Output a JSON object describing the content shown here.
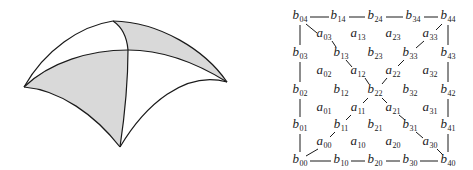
{
  "colors": {
    "stroke": "#1a1a1a",
    "shade": "#d9d9d9",
    "background": "#ffffff"
  },
  "surface_patch": {
    "description": "Triangular surface patch split into four sub-patches, two shaded",
    "corners": {
      "left": [
        24,
        87
      ],
      "top": [
        113,
        21
      ],
      "right": [
        227,
        82
      ],
      "bottom": [
        120,
        147
      ],
      "center": [
        128,
        50
      ]
    }
  },
  "control_net": {
    "b_points": [
      {
        "name": "b",
        "sub": "04",
        "x": 300,
        "y": 17
      },
      {
        "name": "b",
        "sub": "14",
        "x": 338,
        "y": 17
      },
      {
        "name": "b",
        "sub": "24",
        "x": 375,
        "y": 17
      },
      {
        "name": "b",
        "sub": "34",
        "x": 413,
        "y": 17
      },
      {
        "name": "b",
        "sub": "44",
        "x": 448,
        "y": 17
      },
      {
        "name": "b",
        "sub": "03",
        "x": 300,
        "y": 54
      },
      {
        "name": "b",
        "sub": "13",
        "x": 341,
        "y": 54
      },
      {
        "name": "b",
        "sub": "23",
        "x": 375,
        "y": 54
      },
      {
        "name": "b",
        "sub": "33",
        "x": 410,
        "y": 54
      },
      {
        "name": "b",
        "sub": "43",
        "x": 448,
        "y": 54
      },
      {
        "name": "b",
        "sub": "02",
        "x": 300,
        "y": 91
      },
      {
        "name": "b",
        "sub": "12",
        "x": 341,
        "y": 91
      },
      {
        "name": "b",
        "sub": "22",
        "x": 375,
        "y": 91
      },
      {
        "name": "b",
        "sub": "32",
        "x": 410,
        "y": 91
      },
      {
        "name": "b",
        "sub": "42",
        "x": 448,
        "y": 91
      },
      {
        "name": "b",
        "sub": "01",
        "x": 300,
        "y": 126
      },
      {
        "name": "b",
        "sub": "11",
        "x": 341,
        "y": 126
      },
      {
        "name": "b",
        "sub": "21",
        "x": 375,
        "y": 126
      },
      {
        "name": "b",
        "sub": "31",
        "x": 410,
        "y": 126
      },
      {
        "name": "b",
        "sub": "41",
        "x": 448,
        "y": 126
      },
      {
        "name": "b",
        "sub": "00",
        "x": 300,
        "y": 161
      },
      {
        "name": "b",
        "sub": "10",
        "x": 341,
        "y": 161
      },
      {
        "name": "b",
        "sub": "20",
        "x": 375,
        "y": 161
      },
      {
        "name": "b",
        "sub": "30",
        "x": 410,
        "y": 161
      },
      {
        "name": "b",
        "sub": "40",
        "x": 448,
        "y": 161
      }
    ],
    "a_points": [
      {
        "name": "a",
        "sub": "03",
        "x": 324,
        "y": 35
      },
      {
        "name": "a",
        "sub": "13",
        "x": 358,
        "y": 35
      },
      {
        "name": "a",
        "sub": "23",
        "x": 393,
        "y": 35
      },
      {
        "name": "a",
        "sub": "33",
        "x": 430,
        "y": 35
      },
      {
        "name": "a",
        "sub": "02",
        "x": 324,
        "y": 72
      },
      {
        "name": "a",
        "sub": "12",
        "x": 358,
        "y": 72
      },
      {
        "name": "a",
        "sub": "22",
        "x": 393,
        "y": 72
      },
      {
        "name": "a",
        "sub": "32",
        "x": 430,
        "y": 72
      },
      {
        "name": "a",
        "sub": "01",
        "x": 324,
        "y": 109
      },
      {
        "name": "a",
        "sub": "11",
        "x": 358,
        "y": 109
      },
      {
        "name": "a",
        "sub": "21",
        "x": 393,
        "y": 109
      },
      {
        "name": "a",
        "sub": "31",
        "x": 430,
        "y": 109
      },
      {
        "name": "a",
        "sub": "00",
        "x": 324,
        "y": 143
      },
      {
        "name": "a",
        "sub": "10",
        "x": 358,
        "y": 143
      },
      {
        "name": "a",
        "sub": "20",
        "x": 393,
        "y": 143
      },
      {
        "name": "a",
        "sub": "30",
        "x": 430,
        "y": 143
      }
    ],
    "edges": [
      [
        310,
        17,
        329,
        17
      ],
      [
        349,
        17,
        365,
        17
      ],
      [
        386,
        17,
        403,
        17
      ],
      [
        424,
        17,
        438,
        17
      ],
      [
        310,
        161,
        331,
        161
      ],
      [
        351,
        161,
        365,
        161
      ],
      [
        386,
        161,
        400,
        161
      ],
      [
        420,
        161,
        438,
        161
      ],
      [
        300,
        25,
        300,
        45
      ],
      [
        300,
        62,
        300,
        82
      ],
      [
        300,
        99,
        300,
        117
      ],
      [
        300,
        134,
        300,
        152
      ],
      [
        448,
        25,
        448,
        45
      ],
      [
        448,
        62,
        448,
        82
      ],
      [
        448,
        99,
        448,
        117
      ],
      [
        448,
        134,
        448,
        152
      ],
      [
        306,
        24,
        317,
        33
      ],
      [
        332,
        41,
        336,
        47
      ],
      [
        346,
        60,
        352,
        67
      ],
      [
        365,
        78,
        369,
        84
      ],
      [
        442,
        24,
        436,
        30
      ],
      [
        424,
        41,
        416,
        48
      ],
      [
        404,
        60,
        398,
        66
      ],
      [
        387,
        78,
        382,
        84
      ],
      [
        368,
        98,
        363,
        103
      ],
      [
        351,
        115,
        346,
        120
      ],
      [
        335,
        132,
        330,
        137
      ],
      [
        318,
        149,
        306,
        156
      ],
      [
        382,
        98,
        387,
        103
      ],
      [
        399,
        115,
        405,
        120
      ],
      [
        416,
        132,
        423,
        138
      ],
      [
        437,
        149,
        443,
        155
      ]
    ]
  }
}
